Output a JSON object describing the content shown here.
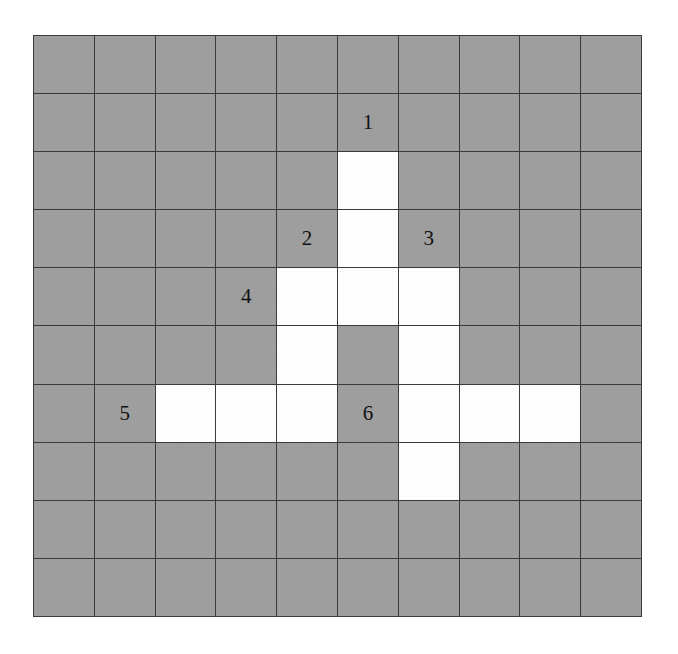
{
  "figure": {
    "name": "grid-diagram",
    "type": "grid",
    "rows": 10,
    "columns": 10,
    "colors": {
      "filled_cell": "#9e9e9e",
      "empty_cell": "#fdfdfd",
      "grid_line": "#3a3a3a",
      "label_text": "#111111",
      "page_background": "#ffffff"
    },
    "legend": {
      "filled_meaning": "shaded square",
      "empty_meaning": "white square"
    }
  },
  "chart_data": {
    "type": "heatmap",
    "title": "",
    "xlabel": "",
    "ylabel": "",
    "rows": 10,
    "columns": 10,
    "value_map": {
      "1": "shaded",
      "0": "white"
    },
    "matrix": [
      [
        1,
        1,
        1,
        1,
        1,
        1,
        1,
        1,
        1,
        1
      ],
      [
        1,
        1,
        1,
        1,
        1,
        1,
        1,
        1,
        1,
        1
      ],
      [
        1,
        1,
        1,
        1,
        1,
        0,
        1,
        1,
        1,
        1
      ],
      [
        1,
        1,
        1,
        1,
        1,
        0,
        1,
        1,
        1,
        1
      ],
      [
        1,
        1,
        1,
        1,
        0,
        0,
        0,
        1,
        1,
        1
      ],
      [
        1,
        1,
        1,
        1,
        0,
        1,
        0,
        1,
        1,
        1
      ],
      [
        1,
        1,
        0,
        0,
        0,
        1,
        0,
        0,
        0,
        1
      ],
      [
        1,
        1,
        1,
        1,
        1,
        1,
        0,
        1,
        1,
        1
      ],
      [
        1,
        1,
        1,
        1,
        1,
        1,
        1,
        1,
        1,
        1
      ],
      [
        1,
        1,
        1,
        1,
        1,
        1,
        1,
        1,
        1,
        1
      ]
    ],
    "white_cells": [
      {
        "row": 2,
        "col": 5
      },
      {
        "row": 3,
        "col": 5
      },
      {
        "row": 4,
        "col": 4
      },
      {
        "row": 4,
        "col": 5
      },
      {
        "row": 4,
        "col": 6
      },
      {
        "row": 5,
        "col": 4
      },
      {
        "row": 5,
        "col": 6
      },
      {
        "row": 6,
        "col": 2
      },
      {
        "row": 6,
        "col": 3
      },
      {
        "row": 6,
        "col": 4
      },
      {
        "row": 6,
        "col": 6
      },
      {
        "row": 6,
        "col": 7
      },
      {
        "row": 6,
        "col": 8
      },
      {
        "row": 7,
        "col": 6
      }
    ],
    "annotations": [
      {
        "label": "1",
        "row": 1,
        "col": 5
      },
      {
        "label": "2",
        "row": 3,
        "col": 4
      },
      {
        "label": "3",
        "row": 3,
        "col": 6
      },
      {
        "label": "4",
        "row": 4,
        "col": 3
      },
      {
        "label": "5",
        "row": 6,
        "col": 1
      },
      {
        "label": "6",
        "row": 6,
        "col": 5
      }
    ]
  }
}
